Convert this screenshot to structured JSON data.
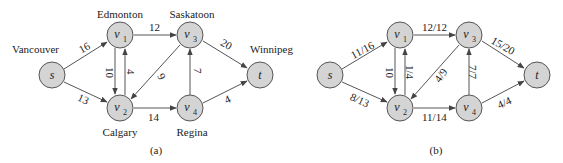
{
  "diagram_a": {
    "caption": "(a)",
    "nodes": {
      "s": {
        "label": "s",
        "sub": "",
        "city": "Vancouver"
      },
      "v1": {
        "label": "v",
        "sub": "1",
        "city": "Edmonton"
      },
      "v2": {
        "label": "v",
        "sub": "2",
        "city": "Calgary"
      },
      "v3": {
        "label": "v",
        "sub": "3",
        "city": "Saskatoon"
      },
      "v4": {
        "label": "v",
        "sub": "4",
        "city": "Regina"
      },
      "t": {
        "label": "t",
        "sub": "",
        "city": "Winnipeg"
      }
    },
    "edges": {
      "s_v1": "16",
      "s_v2": "13",
      "v1_v2": "10",
      "v2_v1": "4",
      "v1_v3": "12",
      "v3_v2": "9",
      "v2_v4": "14",
      "v4_v3": "7",
      "v3_t": "20",
      "v4_t": "4"
    }
  },
  "diagram_b": {
    "caption": "(b)",
    "nodes": {
      "s": {
        "label": "s",
        "sub": ""
      },
      "v1": {
        "label": "v",
        "sub": "1"
      },
      "v2": {
        "label": "v",
        "sub": "2"
      },
      "v3": {
        "label": "v",
        "sub": "3"
      },
      "v4": {
        "label": "v",
        "sub": "4"
      },
      "t": {
        "label": "t",
        "sub": ""
      }
    },
    "edges": {
      "s_v1": "11/16",
      "s_v2": "8/13",
      "v1_v2": "10",
      "v2_v1": "1/4",
      "v1_v3": "12/12",
      "v3_v2": "4/9",
      "v2_v4": "11/14",
      "v4_v3": "7/7",
      "v3_t": "15/20",
      "v4_t": "4/4"
    }
  },
  "colors": {
    "node_fill": "#d4d4d4",
    "stroke": "#555555",
    "text": "#222222"
  }
}
